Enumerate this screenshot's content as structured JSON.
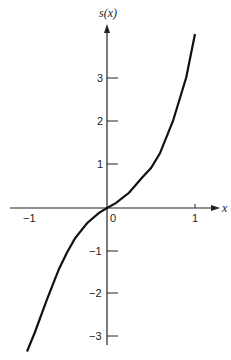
{
  "chart_data": {
    "type": "line",
    "title": "",
    "xlabel": "x",
    "ylabel": "s(x)",
    "xlim": [
      -1.12,
      1.28
    ],
    "ylim": [
      -3.3,
      4.3
    ],
    "x_ticks": [
      "-1",
      "0",
      "1"
    ],
    "y_ticks": [
      "3",
      "2",
      "1",
      "-1",
      "-2",
      "-3"
    ],
    "grid": false,
    "legend": null,
    "series": [
      {
        "name": "s(x)",
        "x": [
          -1.0,
          -0.9,
          -0.75,
          -0.6,
          -0.5,
          -0.4,
          -0.25,
          -0.1,
          0,
          0.1,
          0.25,
          0.4,
          0.5,
          0.6,
          0.75,
          0.9,
          1.0
        ],
        "values": [
          -3.3,
          -2.85,
          -2.1,
          -1.4,
          -1.02,
          -0.7,
          -0.35,
          -0.11,
          0,
          0.11,
          0.35,
          0.7,
          0.92,
          1.25,
          2.0,
          3.0,
          4.0
        ]
      }
    ]
  }
}
